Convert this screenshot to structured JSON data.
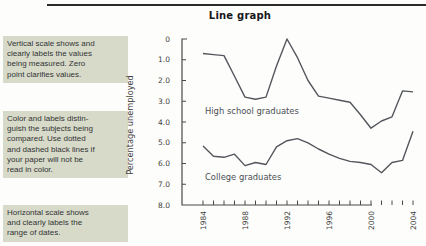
{
  "header": {
    "title": "Line graph"
  },
  "callouts": {
    "vertical_scale": {
      "lines": [
        "Vertical scale shows and",
        "clearly labels the values",
        "being measured. Zero",
        "point clarifies values."
      ]
    },
    "color_labels": {
      "lines": [
        "Color and labels distin-",
        "guish the subjects being",
        "compared. Use dotted",
        "and dashed black lines if",
        "your paper will not be",
        "read in color."
      ]
    },
    "horizontal_scale": {
      "lines": [
        "Horizontal scale shows",
        "and clearly labels the",
        "range of dates."
      ]
    }
  },
  "colors": {
    "callout_bg": "#d7dac9",
    "chart_line": "#53565b",
    "axis": "#4a4a4a",
    "tick_text": "#3f3f40",
    "series_label_text": "#4b4f53",
    "title_text": "#17171a"
  },
  "chart_data": {
    "type": "line",
    "title": "Line graph",
    "xlabel": "",
    "ylabel": "Percentage unemployed",
    "ylim": [
      0,
      8
    ],
    "grid": false,
    "legend_position": "inline-labels",
    "y_tick_values": [
      0,
      1,
      2,
      3,
      4,
      5,
      6,
      7,
      8
    ],
    "y_tick_labels": [
      "0",
      "1.0",
      "2.0",
      "3.0",
      "4.0",
      "5.0",
      "6.0",
      "7.0",
      "8.0"
    ],
    "years": [
      1984,
      1985,
      1986,
      1987,
      1988,
      1989,
      1990,
      1991,
      1992,
      1993,
      1994,
      1995,
      1996,
      1997,
      1998,
      1999,
      2000,
      2001,
      2002,
      2003,
      2004
    ],
    "x_tick_label_years": [
      1984,
      1988,
      1992,
      1996,
      2000,
      2004
    ],
    "series": [
      {
        "name": "High school graduates",
        "values": [
          7.3,
          7.25,
          7.2,
          6.2,
          5.2,
          5.1,
          5.2,
          6.7,
          8.0,
          7.1,
          6.0,
          5.25,
          5.15,
          5.05,
          4.95,
          4.35,
          3.7,
          4.05,
          4.25,
          5.5,
          5.45
        ]
      },
      {
        "name": "College graduates",
        "values": [
          2.85,
          2.35,
          2.3,
          2.45,
          1.9,
          2.05,
          1.95,
          2.8,
          3.1,
          3.2,
          3.0,
          2.7,
          2.45,
          2.25,
          2.1,
          2.05,
          1.95,
          1.55,
          2.05,
          2.15,
          3.55
        ]
      }
    ]
  }
}
